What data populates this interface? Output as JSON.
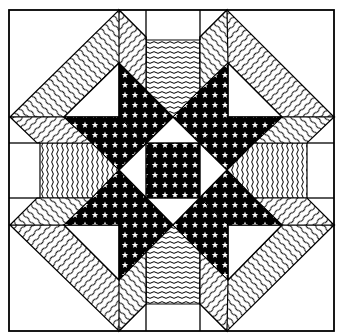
{
  "figure": {
    "width": 343,
    "height": 336
  },
  "colors": {
    "background": "#ffffff",
    "ink": "#000000",
    "paper": "#ffffff"
  },
  "geometry": {
    "border": {
      "x1": 9,
      "y1": 10,
      "x2": 334,
      "y2": 331
    },
    "grid_x": [
      9,
      40,
      64,
      119,
      146,
      173,
      200,
      227,
      282,
      307,
      334
    ],
    "grid_y": [
      10,
      40,
      63,
      117,
      143,
      170,
      198,
      225,
      280,
      304,
      331
    ],
    "center_square": {
      "x": 146,
      "y": 143,
      "w": 54,
      "h": 55
    }
  },
  "patterns": {
    "star_fill": "black-with-white-stars",
    "chevron_fill": "diagonal-wavy-lines",
    "band_fill": "wavy-lines"
  },
  "icons": {
    "star_motif": "white-five-point-star"
  }
}
